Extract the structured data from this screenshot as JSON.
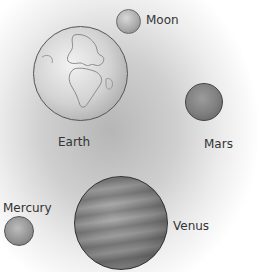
{
  "diagram": {
    "bodies": [
      {
        "id": "moon",
        "label": "Moon"
      },
      {
        "id": "earth",
        "label": "Earth"
      },
      {
        "id": "mars",
        "label": "Mars"
      },
      {
        "id": "mercury",
        "label": "Mercury"
      },
      {
        "id": "venus",
        "label": "Venus"
      }
    ]
  }
}
